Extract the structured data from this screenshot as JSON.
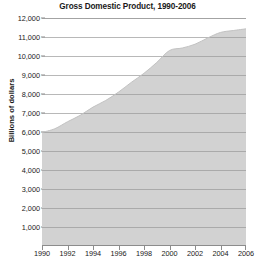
{
  "chart_data": {
    "type": "area",
    "title": "Gross Domestic Product, 1990-2006",
    "xlabel": "",
    "ylabel": "Billions of dollars",
    "xlim": [
      1990,
      2006
    ],
    "ylim": [
      0,
      12000
    ],
    "grid": true,
    "legend": "none",
    "fill_color": "#d2d2d2",
    "line_color": "#c2c2c2",
    "gridline_color": "#9a9a9a",
    "axis_color": "#8c8c8c",
    "text_color": "#1a1a1a",
    "x": [
      1990,
      1991,
      1992,
      1993,
      1994,
      1995,
      1996,
      1997,
      1998,
      1999,
      2000,
      2001,
      2002,
      2003,
      2004,
      2005,
      2006
    ],
    "values": [
      5980,
      6170,
      6540,
      6880,
      7310,
      7660,
      8100,
      8610,
      9090,
      9660,
      10290,
      10630,
      10980,
      11510,
      12270,
      13090,
      13860
    ],
    "y_ticks": [
      {
        "value": 12000,
        "label": "12,000"
      },
      {
        "value": 11000,
        "label": "11,000"
      },
      {
        "value": 10000,
        "label": "10,000"
      },
      {
        "value": 9000,
        "label": "9,000"
      },
      {
        "value": 8000,
        "label": "8,000"
      },
      {
        "value": 7000,
        "label": "7,000"
      },
      {
        "value": 6000,
        "label": "6,000"
      },
      {
        "value": 5000,
        "label": "5,000"
      },
      {
        "value": 4000,
        "label": "4,000"
      },
      {
        "value": 3000,
        "label": "3,000"
      },
      {
        "value": 2000,
        "label": "2,000"
      },
      {
        "value": 1000,
        "label": "1,000"
      }
    ],
    "x_ticks": [
      {
        "value": 1990,
        "label": "1990"
      },
      {
        "value": 1992,
        "label": "1992"
      },
      {
        "value": 1994,
        "label": "1994"
      },
      {
        "value": 1996,
        "label": "1996"
      },
      {
        "value": 1998,
        "label": "1998"
      },
      {
        "value": 2000,
        "label": "2000"
      },
      {
        "value": 2002,
        "label": "2002"
      },
      {
        "value": 2004,
        "label": "2004"
      },
      {
        "value": 2006,
        "label": "2006"
      }
    ],
    "plot_series_values": [
      5980,
      6170,
      6540,
      6880,
      7310,
      7660,
      8100,
      8610,
      9090,
      9660,
      10290,
      10420,
      10620,
      10950,
      11240,
      11340,
      11430
    ]
  }
}
